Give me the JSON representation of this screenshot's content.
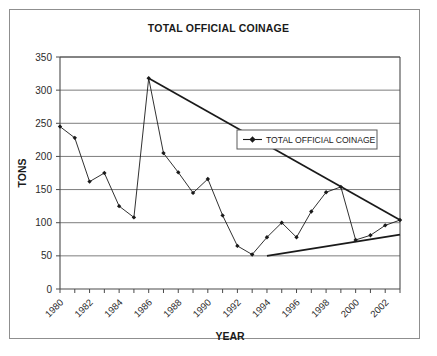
{
  "figure": {
    "title": "TOTAL OFFICIAL COINAGE",
    "frame_color": "#8f8f8f",
    "background": "#ffffff"
  },
  "legend": {
    "entries": [
      {
        "label": "TOTAL OFFICIAL COINAGE",
        "marker": "diamond-marker",
        "color": "#1a1a1a"
      }
    ],
    "position": "upper-right-inside"
  },
  "axes": {
    "x_title": "YEAR",
    "y_title": "TONS",
    "y_ticks": [
      "0",
      "50",
      "100",
      "150",
      "200",
      "250",
      "300",
      "350"
    ],
    "x_ticks_labeled": [
      "1980",
      "1982",
      "1984",
      "1986",
      "1988",
      "1990",
      "1992",
      "1994",
      "1996",
      "1998",
      "2000",
      "2002"
    ]
  },
  "chart_data": {
    "type": "line",
    "title": "TOTAL OFFICIAL COINAGE",
    "xlabel": "YEAR",
    "ylabel": "TONS",
    "xlim": [
      1980,
      2003
    ],
    "ylim": [
      0,
      350
    ],
    "ytick_step": 50,
    "grid": true,
    "grid_axis": "y",
    "legend": "TOTAL OFFICIAL COINAGE",
    "legend_position": "upper right",
    "x": [
      1980,
      1981,
      1982,
      1983,
      1984,
      1985,
      1986,
      1987,
      1988,
      1989,
      1990,
      1991,
      1992,
      1993,
      1994,
      1995,
      1996,
      1997,
      1998,
      1999,
      2000,
      2001,
      2002,
      2003
    ],
    "series": [
      {
        "name": "TOTAL OFFICIAL COINAGE",
        "marker": "diamond",
        "color": "#1a1a1a",
        "values": [
          245,
          228,
          162,
          175,
          125,
          108,
          318,
          205,
          176,
          145,
          166,
          111,
          65,
          52,
          78,
          100,
          78,
          117,
          146,
          154,
          74,
          81,
          96,
          104
        ]
      }
    ],
    "annotations": [
      {
        "type": "trendline",
        "name": "declining-trendline",
        "from": {
          "x": 1986,
          "y": 318
        },
        "to": {
          "x": 2003,
          "y": 104
        },
        "style": "thick solid"
      },
      {
        "type": "trendline",
        "name": "rising-trendline",
        "from": {
          "x": 1994,
          "y": 50
        },
        "to": {
          "x": 2003,
          "y": 82
        },
        "style": "thick solid"
      }
    ]
  }
}
